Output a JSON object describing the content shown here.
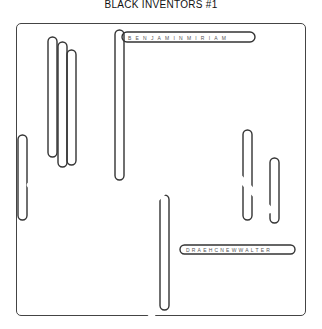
{
  "title": "BLACK INVENTORS #1",
  "puzzle": {
    "grid_size": 22,
    "found_words": [
      {
        "text": "BENJAMINMIRIAM",
        "direction": "horizontal",
        "row": 1
      },
      {
        "text": "DRAEHCNEWWALTER",
        "direction": "horizontal"
      }
    ]
  }
}
